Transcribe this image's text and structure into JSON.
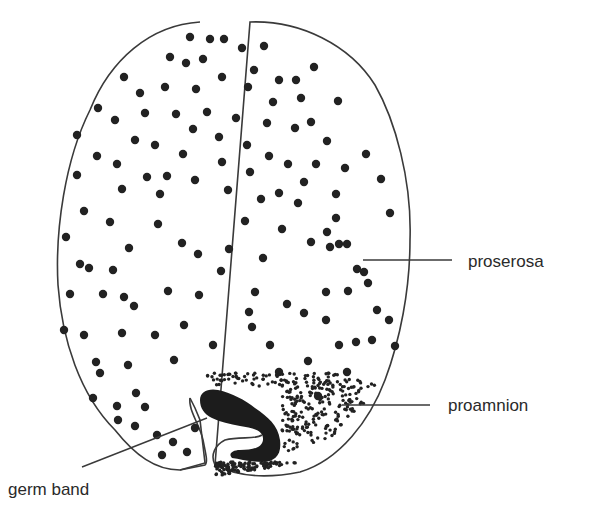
{
  "diagram": {
    "colors": {
      "outline": "#3a3a3a",
      "dot": "#222222",
      "germ_band_fill": "#1c1c1c",
      "background": "#ffffff"
    },
    "labels": [
      {
        "id": "proserosa",
        "text": "proserosa"
      },
      {
        "id": "proamnion",
        "text": "proamnion"
      },
      {
        "id": "germ_band",
        "text": "germ band"
      }
    ]
  }
}
